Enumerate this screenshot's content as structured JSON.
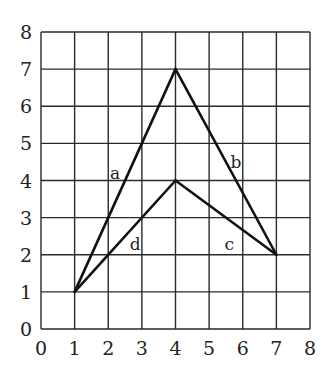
{
  "chart_data": {
    "type": "line",
    "title": "",
    "xlabel": "",
    "ylabel": "",
    "xlim": [
      0,
      8
    ],
    "ylim": [
      0,
      8
    ],
    "grid": true,
    "x_ticks": [
      "0",
      "1",
      "2",
      "3",
      "4",
      "5",
      "6",
      "7",
      "8"
    ],
    "y_ticks": [
      "0",
      "1",
      "2",
      "3",
      "4",
      "5",
      "6",
      "7",
      "8"
    ],
    "series": [
      {
        "name": "a",
        "points": [
          [
            1,
            1
          ],
          [
            4,
            7
          ]
        ]
      },
      {
        "name": "b",
        "points": [
          [
            4,
            7
          ],
          [
            7,
            2
          ]
        ]
      },
      {
        "name": "c",
        "points": [
          [
            4,
            4
          ],
          [
            7,
            2
          ]
        ]
      },
      {
        "name": "d",
        "points": [
          [
            1,
            1
          ],
          [
            4,
            4
          ]
        ]
      }
    ],
    "annotations": [
      {
        "text": "a",
        "x": 2.2,
        "y": 4.2
      },
      {
        "text": "b",
        "x": 5.8,
        "y": 4.5
      },
      {
        "text": "c",
        "x": 5.6,
        "y": 2.3
      },
      {
        "text": "d",
        "x": 2.8,
        "y": 2.3
      }
    ]
  },
  "labels": {
    "a": "a",
    "b": "b",
    "c": "c",
    "d": "d"
  }
}
